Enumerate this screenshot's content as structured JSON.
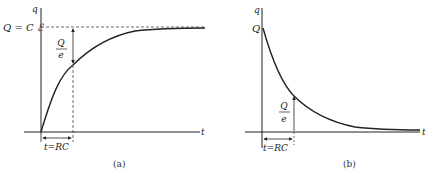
{
  "figure": {
    "panel_a": {
      "caption": "(a)",
      "y_axis_label": "q",
      "x_axis_label": "t",
      "asymptote_label": "Q = C ℰ",
      "fraction_numerator": "Q",
      "fraction_denominator": "e",
      "time_constant_label": "t=RC",
      "curve": "charging: q = Q(1 − e^(−t/RC))"
    },
    "panel_b": {
      "caption": "(b)",
      "y_axis_label": "q",
      "x_axis_label": "t",
      "initial_label": "Q",
      "fraction_numerator": "Q",
      "fraction_denominator": "e",
      "time_constant_label": "t=RC",
      "curve": "discharging: q = Q e^(−t/RC)"
    },
    "colors": {
      "line": "#222222",
      "dashed": "#444444",
      "background": "#ffffff"
    }
  }
}
